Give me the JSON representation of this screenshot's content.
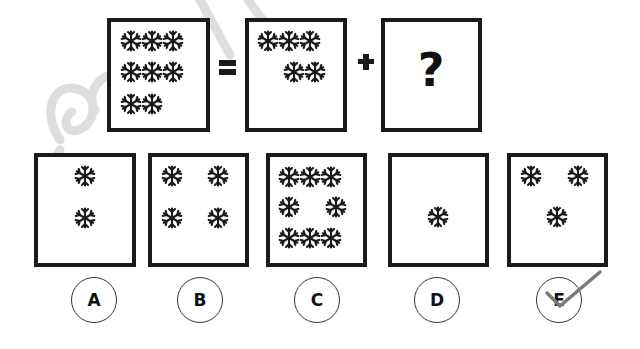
{
  "puzzle": {
    "equation": {
      "equals_symbol": "=",
      "plus_symbol": "+",
      "unknown_symbol": "?",
      "total_count": 8,
      "given_count": 5
    },
    "question_box": {
      "label": "?"
    },
    "icon": "snowflake-icon",
    "colors": {
      "ink": "#1a1a1a",
      "check_mark": "#777777",
      "watermark": "#d9d9d9"
    }
  },
  "options": [
    {
      "letter": "A",
      "count": 2
    },
    {
      "letter": "B",
      "count": 4
    },
    {
      "letter": "C",
      "count": 8
    },
    {
      "letter": "D",
      "count": 1
    },
    {
      "letter": "E",
      "count": 3,
      "checked": true
    }
  ]
}
